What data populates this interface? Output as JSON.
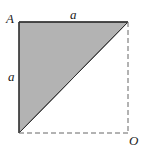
{
  "diagram": {
    "labels": {
      "vertex_a": "A",
      "vertex_o": "O",
      "top_side": "a",
      "left_side": "a"
    },
    "colors": {
      "fill": "#b3b3b3",
      "stroke": "#333333",
      "dashed": "#555555"
    }
  }
}
